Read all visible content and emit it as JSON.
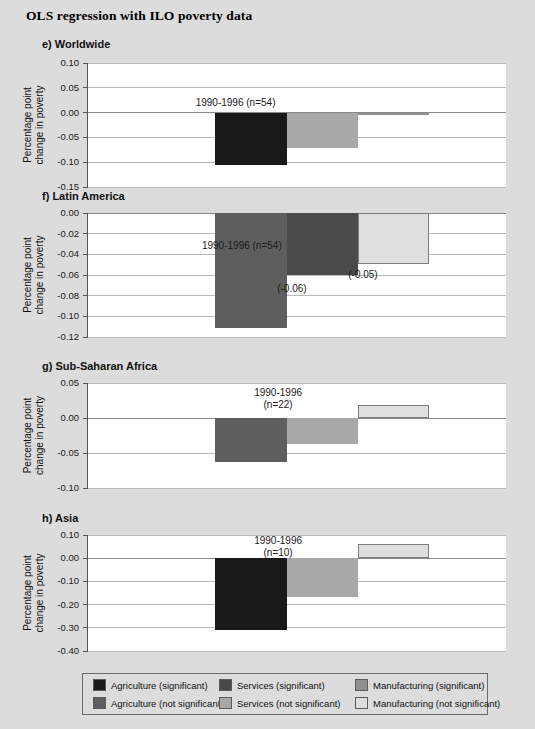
{
  "figure": {
    "title": "OLS regression with ILO poverty data",
    "background_color": "#dcdcdc",
    "plot_background_color": "#ffffff"
  },
  "colors": {
    "agriculture_significant": "#191919",
    "agriculture_not_significant": "#5e5e5e",
    "services_significant": "#4a4a4a",
    "services_not_significant": "#a8a8a8",
    "manufacturing_significant": "#8f8f8f",
    "manufacturing_not_significant": "#dedede",
    "gridline": "#b9b9b9",
    "axis": "#555555"
  },
  "legend": {
    "items": [
      {
        "label": "Agriculture (significant)",
        "color": "#191919",
        "col": 0,
        "row": 0
      },
      {
        "label": "Services (significant)",
        "color": "#4a4a4a",
        "col": 1,
        "row": 0
      },
      {
        "label": "Manufacturing (significant)",
        "color": "#8f8f8f",
        "col": 2,
        "row": 0
      },
      {
        "label": "Agriculture (not significant)",
        "color": "#5e5e5e",
        "col": 0,
        "row": 1
      },
      {
        "label": "Services (not significant)",
        "color": "#a8a8a8",
        "col": 1,
        "row": 1
      },
      {
        "label": "Manufacturing (not significant)",
        "color": "#dedede",
        "col": 2,
        "row": 1
      }
    ]
  },
  "chart_data": [
    {
      "id": "e",
      "type": "bar",
      "title": "e) Worldwide",
      "ylabel": "Percentage point change in poverty",
      "xlabel": "",
      "annotation": "1990-1996 (n=54)",
      "annotations": [],
      "ylim": [
        -0.15,
        0.1
      ],
      "yticks": [
        0.1,
        0.05,
        0.0,
        -0.05,
        -0.1,
        -0.15
      ],
      "ytick_labels": [
        "0.10",
        "0.05",
        "0.00",
        "-0.05",
        "-0.10",
        "-0.15"
      ],
      "grid": true,
      "categories": [
        "Agriculture",
        "Services",
        "Manufacturing"
      ],
      "values": [
        -0.105,
        -0.071,
        -0.003
      ],
      "series_styles": [
        "agriculture_significant",
        "services_not_significant",
        "manufacturing_significant"
      ],
      "legend_position": "bottom-shared"
    },
    {
      "id": "f",
      "type": "bar",
      "title": "f) Latin America",
      "ylabel": "Percentage point change in poverty",
      "xlabel": "",
      "annotation": "1990-1996 (n=54)",
      "annotations": [
        "(-0.06)",
        "(-0.05)"
      ],
      "ylim": [
        -0.12,
        0.0
      ],
      "yticks": [
        0.0,
        -0.02,
        -0.04,
        -0.06,
        -0.08,
        -0.1,
        -0.12
      ],
      "ytick_labels": [
        "0.00",
        "-0.02",
        "-0.04",
        "-0.06",
        "-0.08",
        "-0.10",
        "-0.12"
      ],
      "grid": true,
      "categories": [
        "Agriculture",
        "Services",
        "Manufacturing"
      ],
      "values": [
        -0.111,
        -0.06,
        -0.049
      ],
      "series_styles": [
        "agriculture_not_significant",
        "services_significant",
        "manufacturing_not_significant"
      ],
      "legend_position": "bottom-shared"
    },
    {
      "id": "g",
      "type": "bar",
      "title": "g) Sub-Saharan Africa",
      "ylabel": "Percentage point change in poverty",
      "xlabel": "",
      "annotation": "1990-1996 (n=22)",
      "annotations": [],
      "ylim": [
        -0.1,
        0.05
      ],
      "yticks": [
        0.05,
        0.0,
        -0.05,
        -0.1
      ],
      "ytick_labels": [
        "0.05",
        "0.00",
        "-0.05",
        "-0.10"
      ],
      "grid": true,
      "categories": [
        "Agriculture",
        "Services",
        "Manufacturing"
      ],
      "values": [
        -0.063,
        -0.037,
        0.019
      ],
      "series_styles": [
        "agriculture_not_significant",
        "services_not_significant",
        "manufacturing_not_significant"
      ],
      "legend_position": "bottom-shared"
    },
    {
      "id": "h",
      "type": "bar",
      "title": "h) Asia",
      "ylabel": "Percentage point change in poverty",
      "xlabel": "",
      "annotation": "1990-1996 (n=10)",
      "annotations": [],
      "ylim": [
        -0.4,
        0.1
      ],
      "yticks": [
        0.1,
        0.0,
        -0.1,
        -0.2,
        -0.3,
        -0.4
      ],
      "ytick_labels": [
        "0.10",
        "0.00",
        "-0.10",
        "-0.20",
        "-0.30",
        "-0.40"
      ],
      "grid": true,
      "categories": [
        "Agriculture",
        "Services",
        "Manufacturing"
      ],
      "values": [
        -0.308,
        -0.168,
        0.062
      ],
      "series_styles": [
        "agriculture_significant",
        "services_not_significant",
        "manufacturing_not_significant"
      ],
      "legend_position": "bottom-shared"
    }
  ]
}
